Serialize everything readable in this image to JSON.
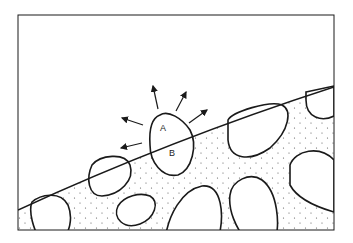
{
  "diagram": {
    "type": "schematic",
    "labels": {
      "region_above": "A",
      "region_below": "B"
    },
    "colors": {
      "stroke": "#1a1a1a",
      "background": "#ffffff",
      "dots": "#555555"
    }
  }
}
